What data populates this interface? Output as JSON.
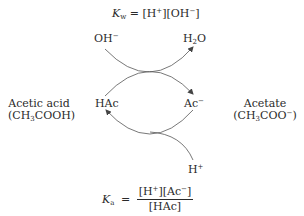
{
  "equations": {
    "kw": {
      "symbol": "K",
      "subscript": "w",
      "rhs_parts": [
        "= [H",
        "+",
        "][OH",
        "−",
        "]"
      ]
    },
    "ka": {
      "symbol": "K",
      "subscript": "a",
      "equals": "=",
      "numerator_parts": [
        "[H",
        "+",
        "][Ac",
        "−",
        "]"
      ],
      "denominator": "[HAc]"
    }
  },
  "species": {
    "hydroxide": {
      "base": "OH",
      "charge": "−"
    },
    "water": {
      "pre": "H",
      "sub": "2",
      "post": "O"
    },
    "hac": {
      "label": "HAc"
    },
    "ac": {
      "base": "Ac",
      "charge": "−"
    },
    "proton": {
      "base": "H",
      "charge": "+"
    }
  },
  "compounds": {
    "acetic_acid": {
      "name": "Acetic acid",
      "formula_pre": "(CH",
      "formula_sub": "3",
      "formula_post": "COOH)"
    },
    "acetate": {
      "name": "Acetate",
      "formula_pre": "(CH",
      "formula_sub": "3",
      "formula_post": "COO",
      "formula_sup": "−",
      "formula_end": ")"
    }
  },
  "colors": {
    "line": "#555555",
    "text": "#2a2a2a"
  }
}
